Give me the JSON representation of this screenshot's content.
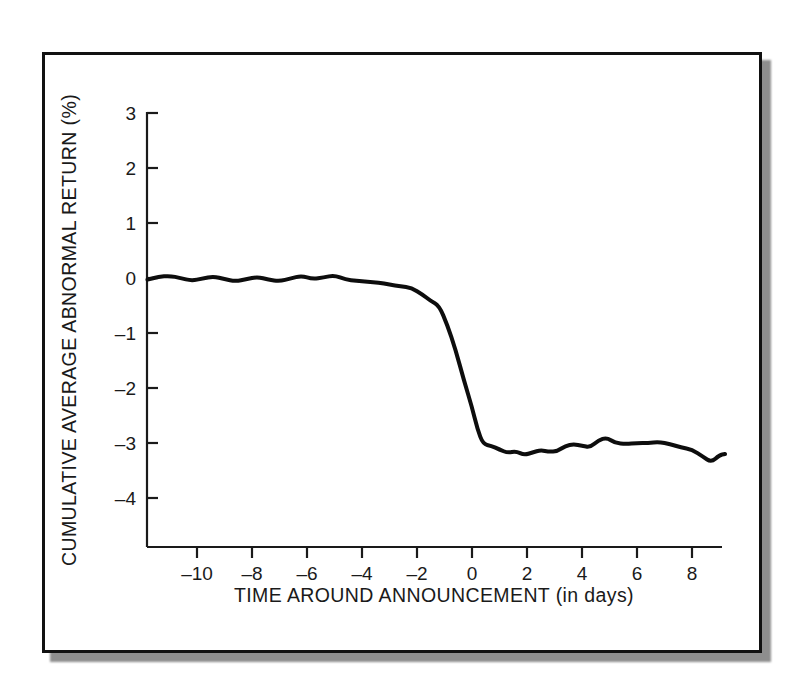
{
  "figure": {
    "background_color": "#ffffff",
    "frame_color": "#111111",
    "line_color": "#0d0d0d",
    "axis_color": "#1a1a1a"
  },
  "chart_data": {
    "type": "line",
    "title": "",
    "subtitle": "",
    "xlabel": "TIME AROUND ANNOUNCEMENT (in days)",
    "ylabel": "CUMULATIVE AVERAGE ABNORMAL RETURN (%)",
    "xlim": [
      -11.8,
      9.3
    ],
    "ylim": [
      -4.9,
      3.0
    ],
    "xticks": [
      -10,
      -8,
      -6,
      -4,
      -2,
      0,
      2,
      4,
      6,
      8
    ],
    "xtick_labels": [
      "–10",
      "–8",
      "–6",
      "–4",
      "–2",
      "0",
      "2",
      "4",
      "6",
      "8"
    ],
    "yticks": [
      3,
      2,
      1,
      0,
      -1,
      -2,
      -3,
      -4
    ],
    "ytick_labels": [
      "3",
      "2",
      "1",
      "0",
      "–1",
      "–2",
      "–3",
      "–4"
    ],
    "grid": false,
    "legend": null,
    "legend_position": "none",
    "annotations": [],
    "series": [
      {
        "name": "Cumulative average abnormal return",
        "line_width": 4,
        "x": [
          -11.8,
          -11.4,
          -11.0,
          -10.6,
          -10.2,
          -9.8,
          -9.4,
          -9.0,
          -8.6,
          -8.2,
          -7.8,
          -7.4,
          -7.0,
          -6.6,
          -6.2,
          -5.8,
          -5.4,
          -5.0,
          -4.6,
          -4.2,
          -3.8,
          -3.4,
          -3.0,
          -2.6,
          -2.2,
          -1.8,
          -1.5,
          -1.2,
          -0.9,
          -0.6,
          -0.3,
          0.0,
          0.2,
          0.4,
          0.7,
          1.0,
          1.3,
          1.6,
          1.9,
          2.2,
          2.5,
          2.8,
          3.1,
          3.4,
          3.7,
          4.0,
          4.3,
          4.6,
          4.9,
          5.2,
          5.6,
          6.0,
          6.4,
          6.8,
          7.2,
          7.6,
          8.0,
          8.4,
          8.7,
          9.0,
          9.2
        ],
        "y": [
          -0.03,
          0.02,
          0.04,
          0.0,
          -0.05,
          -0.01,
          0.03,
          -0.02,
          -0.06,
          -0.02,
          0.02,
          -0.03,
          -0.06,
          -0.01,
          0.04,
          -0.02,
          0.01,
          0.05,
          -0.03,
          -0.05,
          -0.07,
          -0.08,
          -0.12,
          -0.15,
          -0.18,
          -0.3,
          -0.42,
          -0.5,
          -0.85,
          -1.3,
          -1.85,
          -2.35,
          -2.75,
          -3.02,
          -3.05,
          -3.12,
          -3.18,
          -3.15,
          -3.22,
          -3.17,
          -3.13,
          -3.16,
          -3.15,
          -3.05,
          -3.02,
          -3.05,
          -3.08,
          -2.95,
          -2.9,
          -3.0,
          -3.02,
          -3.0,
          -3.0,
          -2.98,
          -3.02,
          -3.08,
          -3.12,
          -3.25,
          -3.35,
          -3.22,
          -3.2
        ]
      }
    ]
  }
}
